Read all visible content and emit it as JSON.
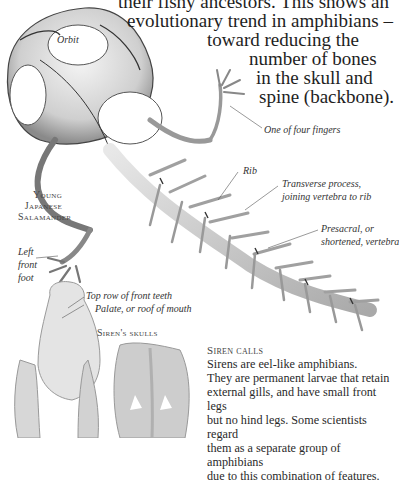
{
  "intro": {
    "lines": [
      "their fishy ancestors. This shows an",
      "evolutionary trend in amphibians –",
      "toward reducing the",
      "number of bones",
      "in the skull and",
      "spine (backbone)."
    ]
  },
  "specimen": {
    "title_lines": [
      "Young",
      "Japanese",
      "Salamander"
    ]
  },
  "labels": {
    "orbit": "Orbit",
    "finger": "One of four fingers",
    "rib": "Rib",
    "transverse_1": "Transverse process,",
    "transverse_2": "joining vertebra to rib",
    "presacral_1": "Presacral, or",
    "presacral_2": "shortened, vertebra",
    "left_front_foot": [
      "Left",
      "front",
      "foot"
    ],
    "top_teeth": "Top row of front teeth",
    "palate": "Palate, or roof of mouth"
  },
  "siren_skulls_caption": "Siren's skulls",
  "siren_box": {
    "heading": "Siren calls",
    "lines": [
      "Sirens are eel-like amphibians.",
      "They are permanent larvae that retain",
      "external gills, and have small front legs",
      "but no hind legs. Some scientists regard",
      "them as a separate group of amphibians",
      "due to this combination of features."
    ]
  }
}
